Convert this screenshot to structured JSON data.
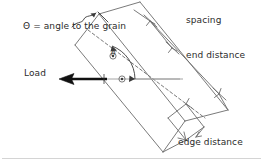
{
  "diagram": {
    "style": "hand-drawn engineering sketch",
    "stroke_color": "#6b6b6b",
    "bold_stroke_color": "#111111",
    "text_color": "#2b2b2b",
    "background": "#ffffff"
  },
  "labels": {
    "theta_definition": "Θ = angle to the grain",
    "theta_symbol": "θ",
    "load": "Load",
    "spacing": "spacing",
    "end_distance": "end distance",
    "edge_distance": "edge distance"
  },
  "icons": {
    "load_arrow": "left-arrow-icon",
    "angle_arc": "angle-arc-icon",
    "fastener": "fastener-circle-icon",
    "leader_squiggle": "leader-squiggle-icon",
    "dimension_tick": "dimension-tick-icon"
  },
  "geometry": {
    "member_angle_deg": 35,
    "fasteners": [
      {
        "cx": 122,
        "cy": 79
      },
      {
        "cx": 113,
        "cy": 56
      }
    ],
    "load_line": {
      "x1": 60,
      "y1": 79,
      "x2": 180,
      "y2": 79
    },
    "arrow_tip": {
      "x": 62,
      "y": 79
    }
  }
}
